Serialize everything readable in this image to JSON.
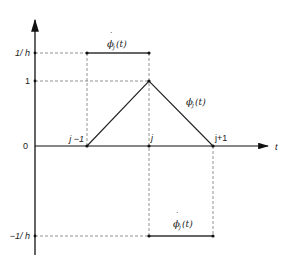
{
  "diagram": {
    "axis_label_t": "t",
    "y_ticks": [
      {
        "id": "inv-h",
        "label": "1/ h"
      },
      {
        "id": "one",
        "label": "1"
      },
      {
        "id": "zero",
        "label": "0"
      },
      {
        "id": "neg-inv-h",
        "label": "−1/ h"
      }
    ],
    "x_nodes": [
      {
        "id": "j-minus-1",
        "label": "j −1"
      },
      {
        "id": "j",
        "label": "j"
      },
      {
        "id": "j-plus-1",
        "label": "j+1"
      }
    ],
    "labels": {
      "phi": "ϕ",
      "phi_sub": "j",
      "phi_arg": "(t)",
      "phi_dot": "·"
    }
  }
}
